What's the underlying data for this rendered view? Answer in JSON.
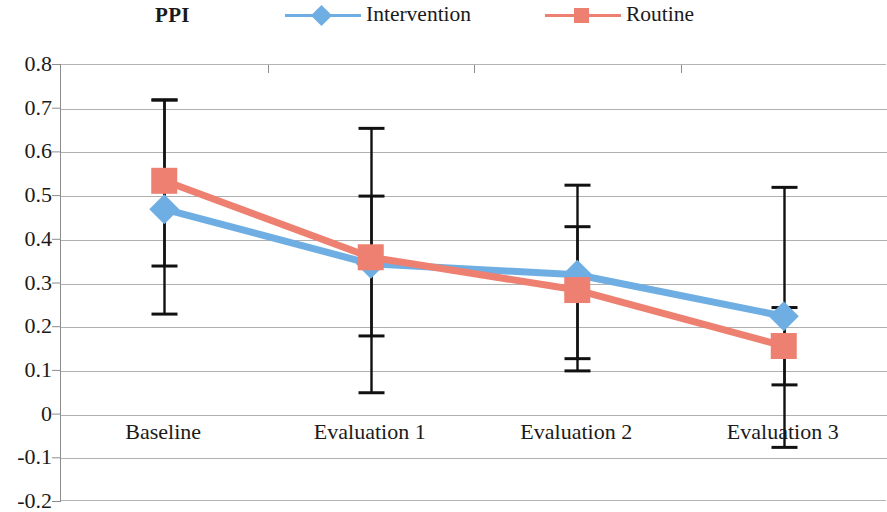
{
  "chart_title": "PPI",
  "legend": {
    "position": "top",
    "entries": [
      {
        "label": "Intervention",
        "color": "#6FAEE3",
        "marker": "diamond"
      },
      {
        "label": "Routine",
        "color": "#ED8070",
        "marker": "square"
      }
    ]
  },
  "axes": {
    "y_ticks": [
      "0.8",
      "0.7",
      "0.6",
      "0.5",
      "0.4",
      "0.3",
      "0.2",
      "0.1",
      "0",
      "-0.1",
      "-0.2"
    ],
    "x_ticks": [
      "Baseline",
      "Evaluation 1",
      "Evaluation 2",
      "Evaluation 3"
    ]
  },
  "chart_data": {
    "type": "line",
    "title": "PPI",
    "xlabel": "",
    "ylabel": "",
    "ylim": [
      -0.2,
      0.8
    ],
    "ytick_step": 0.1,
    "grid": true,
    "legend_position": "top",
    "error_bars": "black vertical bars with caps",
    "categories": [
      "Baseline",
      "Evaluation 1",
      "Evaluation 2",
      "Evaluation 3"
    ],
    "series": [
      {
        "name": "Intervention",
        "color": "#6FAEE3",
        "marker": "diamond",
        "values": [
          0.47,
          0.345,
          0.32,
          0.225
        ],
        "error_upper": [
          0.72,
          0.655,
          0.525,
          0.52
        ],
        "error_lower": [
          0.23,
          0.05,
          0.1,
          -0.075
        ]
      },
      {
        "name": "Routine",
        "color": "#ED8070",
        "marker": "square",
        "values": [
          0.535,
          0.36,
          0.285,
          0.157
        ],
        "error_upper": [
          0.72,
          0.5,
          0.43,
          0.245
        ],
        "error_lower": [
          0.34,
          0.18,
          0.128,
          0.068
        ]
      }
    ]
  },
  "colors": {
    "intervention": "#6FAEE3",
    "routine": "#ED8070",
    "grid": "#b0b0b0",
    "axis": "#8c8c8c",
    "error_bar": "#111111"
  }
}
